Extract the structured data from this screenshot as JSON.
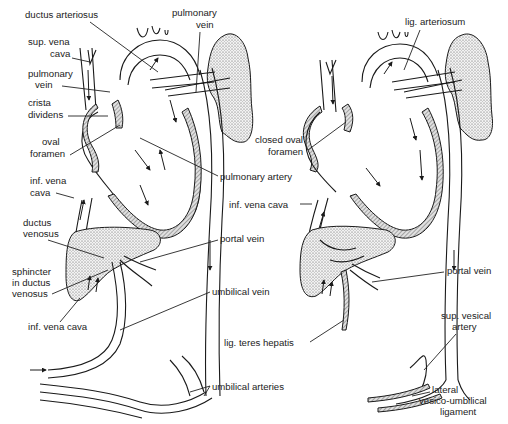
{
  "figure": {
    "panels": [
      {
        "id": "fetal",
        "labels": [
          {
            "key": "ductus_arteriosus",
            "text": "ductus arteriosus",
            "x": 25,
            "y": 18
          },
          {
            "key": "pulmonary_vein_top_1",
            "text": "pulmonary",
            "x": 172,
            "y": 16
          },
          {
            "key": "pulmonary_vein_top_2",
            "text": "vein",
            "x": 196,
            "y": 28
          },
          {
            "key": "sup_vena_cava_1",
            "text": "sup. vena",
            "x": 28,
            "y": 45
          },
          {
            "key": "sup_vena_cava_2",
            "text": "cava",
            "x": 50,
            "y": 57
          },
          {
            "key": "pulmonary_vein_1",
            "text": "pulmonary",
            "x": 28,
            "y": 77
          },
          {
            "key": "pulmonary_vein_2",
            "text": "vein",
            "x": 35,
            "y": 88
          },
          {
            "key": "crista_dividens_1",
            "text": "crista",
            "x": 28,
            "y": 106
          },
          {
            "key": "crista_dividens_2",
            "text": "dividens",
            "x": 28,
            "y": 118
          },
          {
            "key": "oval_foramen_1",
            "text": "oval",
            "x": 42,
            "y": 145
          },
          {
            "key": "oval_foramen_2",
            "text": "foramen",
            "x": 30,
            "y": 157
          },
          {
            "key": "pulmonary_artery",
            "text": "pulmonary artery",
            "x": 220,
            "y": 180
          },
          {
            "key": "inf_vena_cava_1",
            "text": "inf. vena",
            "x": 30,
            "y": 184
          },
          {
            "key": "inf_vena_cava_2",
            "text": "cava",
            "x": 30,
            "y": 196
          },
          {
            "key": "ductus_venosus_1",
            "text": "ductus",
            "x": 23,
            "y": 226
          },
          {
            "key": "ductus_venosus_2",
            "text": "venosus",
            "x": 23,
            "y": 237
          },
          {
            "key": "portal_vein",
            "text": "portal vein",
            "x": 220,
            "y": 242
          },
          {
            "key": "sphincter_1",
            "text": "sphincter",
            "x": 12,
            "y": 275
          },
          {
            "key": "sphincter_2",
            "text": "in ductus",
            "x": 12,
            "y": 286
          },
          {
            "key": "sphincter_3",
            "text": "venosus",
            "x": 12,
            "y": 297
          },
          {
            "key": "umbilical_vein",
            "text": "umbilical vein",
            "x": 212,
            "y": 295
          },
          {
            "key": "inf_vena_cava_lower",
            "text": "inf. vena cava",
            "x": 28,
            "y": 330
          },
          {
            "key": "umbilical_arteries",
            "text": "umbilical arteries",
            "x": 212,
            "y": 390
          }
        ]
      },
      {
        "id": "adult",
        "labels": [
          {
            "key": "lig_arteriosum",
            "text": "lig. arteriosum",
            "x": 405,
            "y": 25
          },
          {
            "key": "closed_oval_foramen_1",
            "text": "closed oval",
            "x": 255,
            "y": 143
          },
          {
            "key": "closed_oval_foramen_2",
            "text": "foramen",
            "x": 268,
            "y": 155
          },
          {
            "key": "inf_vena_cava",
            "text": "inf. vena cava",
            "x": 229,
            "y": 208
          },
          {
            "key": "portal_vein",
            "text": "portal vein",
            "x": 447,
            "y": 274
          },
          {
            "key": "lig_teres_hepatis",
            "text": "lig. teres hepatis",
            "x": 224,
            "y": 346
          },
          {
            "key": "sup_vesical_artery_1",
            "text": "sup. vesical",
            "x": 441,
            "y": 319
          },
          {
            "key": "sup_vesical_artery_2",
            "text": "artery",
            "x": 452,
            "y": 330
          },
          {
            "key": "lateral_1",
            "text": "lateral",
            "x": 432,
            "y": 393
          },
          {
            "key": "lateral_2",
            "text": "vesico-umbilical",
            "x": 419,
            "y": 404
          },
          {
            "key": "lateral_3",
            "text": "ligament",
            "x": 440,
            "y": 415
          }
        ]
      }
    ]
  }
}
